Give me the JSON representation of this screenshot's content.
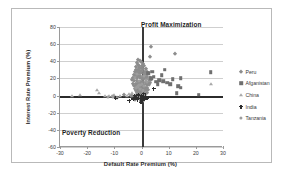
{
  "chart_data": {
    "type": "scatter",
    "title": "",
    "xlabel": "Default Rate Premium (%)",
    "ylabel": "Interest Rate Premium (%)",
    "xlim": [
      -30,
      30
    ],
    "ylim": [
      -60,
      80
    ],
    "xticks": [
      -30,
      -20,
      -10,
      0,
      10,
      20,
      30
    ],
    "yticks": [
      -60,
      -40,
      -20,
      0,
      20,
      40,
      60,
      80
    ],
    "grid": "horizontal",
    "legend_position": "right",
    "annotations": [
      {
        "text": "Profit Maximization",
        "quadrant": "upper-right"
      },
      {
        "text": "Poverty Reduction",
        "quadrant": "lower-left"
      }
    ],
    "reference_lines": [
      {
        "axis": "y",
        "value": 0
      },
      {
        "axis": "x",
        "value": 0
      }
    ],
    "series": [
      {
        "name": "Peru",
        "marker": "diamond",
        "color": "#8d8d8d",
        "points": [
          [
            -1.2,
            42
          ],
          [
            -0.6,
            40
          ],
          [
            -1.8,
            38
          ],
          [
            -0.2,
            39
          ],
          [
            0.4,
            37
          ],
          [
            -1.4,
            36
          ],
          [
            -0.8,
            35
          ],
          [
            0.2,
            34
          ],
          [
            1.0,
            34
          ],
          [
            -1.9,
            33
          ],
          [
            -1.0,
            32
          ],
          [
            -0.3,
            32
          ],
          [
            0.7,
            31
          ],
          [
            1.5,
            31
          ],
          [
            -2.1,
            30
          ],
          [
            -1.3,
            30
          ],
          [
            -0.5,
            29
          ],
          [
            0.3,
            29
          ],
          [
            1.2,
            28
          ],
          [
            2.0,
            28
          ],
          [
            -2.4,
            27
          ],
          [
            -1.6,
            27
          ],
          [
            -0.9,
            26
          ],
          [
            -0.1,
            26
          ],
          [
            0.8,
            25
          ],
          [
            1.7,
            25
          ],
          [
            2.5,
            25
          ],
          [
            -2.8,
            24
          ],
          [
            -2.0,
            24
          ],
          [
            -1.2,
            23
          ],
          [
            -0.4,
            23
          ],
          [
            0.5,
            22
          ],
          [
            1.4,
            22
          ],
          [
            2.2,
            22
          ],
          [
            3.0,
            21
          ],
          [
            -3.1,
            21
          ],
          [
            -2.3,
            20
          ],
          [
            -1.5,
            20
          ],
          [
            -0.7,
            20
          ],
          [
            0.1,
            19
          ],
          [
            0.9,
            19
          ],
          [
            1.8,
            19
          ],
          [
            2.7,
            18
          ],
          [
            3.4,
            18
          ],
          [
            -3.4,
            18
          ],
          [
            -2.6,
            17
          ],
          [
            -1.8,
            17
          ],
          [
            -1.0,
            16
          ],
          [
            -0.2,
            16
          ],
          [
            0.6,
            16
          ],
          [
            1.5,
            15
          ],
          [
            2.3,
            15
          ],
          [
            3.1,
            15
          ],
          [
            -3.0,
            14
          ],
          [
            -2.2,
            14
          ],
          [
            -1.4,
            13
          ],
          [
            -0.6,
            13
          ],
          [
            0.2,
            13
          ],
          [
            1.1,
            12
          ],
          [
            1.9,
            12
          ],
          [
            2.8,
            12
          ],
          [
            -2.7,
            11
          ],
          [
            -1.9,
            11
          ],
          [
            -1.1,
            10
          ],
          [
            -0.3,
            10
          ],
          [
            0.5,
            10
          ],
          [
            1.3,
            9
          ],
          [
            2.1,
            9
          ],
          [
            -2.4,
            8
          ],
          [
            -1.6,
            8
          ],
          [
            -0.8,
            7
          ],
          [
            0.0,
            7
          ],
          [
            0.8,
            7
          ],
          [
            1.6,
            6
          ],
          [
            2.4,
            6
          ],
          [
            -2.1,
            5
          ],
          [
            -1.3,
            5
          ],
          [
            -0.5,
            4
          ],
          [
            0.3,
            4
          ],
          [
            1.1,
            4
          ],
          [
            1.9,
            3
          ],
          [
            -1.8,
            3
          ],
          [
            -1.0,
            2
          ],
          [
            -0.2,
            2
          ],
          [
            0.6,
            2
          ],
          [
            1.4,
            1
          ],
          [
            -1.5,
            1
          ],
          [
            -0.7,
            0
          ],
          [
            0.1,
            0
          ],
          [
            0.9,
            0
          ],
          [
            -1.2,
            -1
          ],
          [
            -0.4,
            -1
          ],
          [
            0.4,
            -2
          ],
          [
            1.2,
            -2
          ],
          [
            -0.9,
            -3
          ],
          [
            -0.1,
            -3
          ],
          [
            0.7,
            -4
          ],
          [
            -0.6,
            -4
          ],
          [
            0.2,
            -5
          ],
          [
            -0.3,
            -6
          ],
          [
            0.5,
            -6
          ],
          [
            -0.1,
            -7
          ],
          [
            3.5,
            57
          ],
          [
            12.5,
            49
          ],
          [
            3.2,
            45
          ],
          [
            -6.5,
            1
          ],
          [
            -9.0,
            -3
          ],
          [
            -3.5,
            -1
          ],
          [
            -2.5,
            -5
          ],
          [
            -4.0,
            0
          ]
        ]
      },
      {
        "name": "Afganistan",
        "marker": "square",
        "color": "#6f6f6f",
        "points": [
          [
            8.5,
            30
          ],
          [
            25.5,
            27
          ],
          [
            7.5,
            24
          ],
          [
            14.5,
            20
          ],
          [
            11.5,
            19
          ],
          [
            6.5,
            18
          ],
          [
            8.0,
            17
          ],
          [
            5.5,
            16
          ],
          [
            9.5,
            15
          ],
          [
            13.5,
            11
          ],
          [
            14.5,
            9
          ],
          [
            13.0,
            3
          ],
          [
            21.0,
            1
          ],
          [
            4.5,
            22
          ],
          [
            3.5,
            20
          ],
          [
            6.0,
            13
          ],
          [
            10.5,
            13
          ],
          [
            2.5,
            26
          ],
          [
            4.0,
            28
          ]
        ]
      },
      {
        "name": "China",
        "marker": "triangle",
        "color": "#a8a8a8",
        "points": [
          [
            -25.5,
            0
          ],
          [
            -22.5,
            1
          ],
          [
            -15.5,
            3
          ],
          [
            -16.5,
            7
          ],
          [
            -13.5,
            0
          ],
          [
            -12.0,
            -1
          ],
          [
            -11.0,
            0
          ],
          [
            -10.0,
            1
          ],
          [
            -4.5,
            2
          ],
          [
            -3.5,
            3
          ],
          [
            -2.5,
            1
          ],
          [
            25.5,
            13
          ],
          [
            -5.5,
            0
          ],
          [
            -8.0,
            -1
          ]
        ]
      },
      {
        "name": "India",
        "marker": "cross",
        "color": "#2e2e2e",
        "points": [
          [
            -1.0,
            0
          ],
          [
            0.0,
            -1
          ],
          [
            0.5,
            -2
          ],
          [
            -0.5,
            -3
          ],
          [
            1.0,
            -4
          ],
          [
            -1.5,
            -5
          ],
          [
            0.2,
            -6
          ],
          [
            -2.0,
            -2
          ],
          [
            1.5,
            -1
          ],
          [
            -2.5,
            0
          ],
          [
            4.5,
            8
          ],
          [
            -9.5,
            -3
          ],
          [
            -1.2,
            1
          ],
          [
            0.8,
            2
          ],
          [
            -0.2,
            -8
          ],
          [
            2.0,
            -3
          ],
          [
            -3.0,
            -4
          ],
          [
            -4.5,
            -6
          ]
        ]
      },
      {
        "name": "Tanzania",
        "marker": "circle",
        "color": "#9d9d9d",
        "points": [
          [
            -10.5,
            -1
          ],
          [
            -12.5,
            -2
          ],
          [
            -0.5,
            8
          ],
          [
            0.5,
            6
          ],
          [
            -1.5,
            10
          ],
          [
            1.0,
            11
          ],
          [
            -2.0,
            9
          ],
          [
            0.0,
            14
          ],
          [
            -1.0,
            17
          ],
          [
            1.5,
            18
          ],
          [
            -2.5,
            21
          ],
          [
            0.8,
            23
          ],
          [
            -1.8,
            25
          ],
          [
            2.0,
            16
          ],
          [
            -0.8,
            12
          ]
        ]
      }
    ]
  },
  "legend": {
    "items": [
      {
        "label": "Peru",
        "marker": "diamond"
      },
      {
        "label": "Afganistan",
        "marker": "square"
      },
      {
        "label": "China",
        "marker": "triangle"
      },
      {
        "label": "India",
        "marker": "cross"
      },
      {
        "label": "Tanzania",
        "marker": "circle"
      }
    ]
  }
}
